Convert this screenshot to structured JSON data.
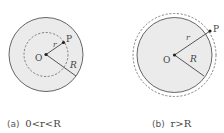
{
  "figures": [
    {
      "id": "a",
      "center_label": "O",
      "point_label": "P",
      "r_label": "r",
      "R_label": "R",
      "caption_tag": "(a)",
      "caption_math": "0<r<R"
    },
    {
      "id": "b",
      "center_label": "O",
      "point_label": "P",
      "r_label": "r",
      "R_label": "R",
      "caption_tag": "(b)",
      "caption_math": "r>R"
    }
  ],
  "colors": {
    "fill": "#ebebeb",
    "stroke": "#555555",
    "dash": "#666666"
  }
}
